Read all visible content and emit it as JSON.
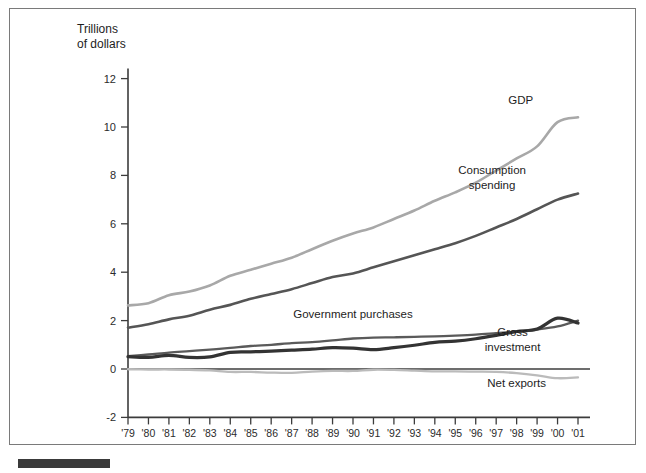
{
  "figure": {
    "y_axis_title_line1": "Trillions",
    "y_axis_title_line2": "of dollars",
    "x_axis_title": "Year"
  },
  "labels": {
    "gdp": "GDP",
    "consumption_line1": "Consumption",
    "consumption_line2": "spending",
    "government": "Government purchases",
    "gross_line1": "Gross",
    "gross_line2": "investment",
    "net_exports": "Net exports"
  },
  "colors": {
    "gdp": "#a8a8a8",
    "consumption": "#555555",
    "government": "#5a5a5a",
    "gross_investment": "#333333",
    "net_exports": "#bbbbbb",
    "axis": "#3c3c3c",
    "frame": "#7a7a7a"
  },
  "chart_data": {
    "type": "line",
    "title": "",
    "xlabel": "Year",
    "ylabel": "Trillions of dollars",
    "grid": false,
    "legend_position": "inline-annotations",
    "xlim": [
      1979,
      2001
    ],
    "ylim": [
      -2,
      12
    ],
    "yticks": [
      -2,
      0,
      2,
      4,
      6,
      8,
      10,
      12
    ],
    "ytick_labels": [
      "-2",
      "0",
      "2",
      "4",
      "6",
      "8",
      "10",
      "12"
    ],
    "x": [
      1979,
      1980,
      1981,
      1982,
      1983,
      1984,
      1985,
      1986,
      1987,
      1988,
      1989,
      1990,
      1991,
      1992,
      1993,
      1994,
      1995,
      1996,
      1997,
      1998,
      1999,
      2000,
      2001
    ],
    "xtick_labels": [
      "'79",
      "'80",
      "'81",
      "'82",
      "'83",
      "'84",
      "'85",
      "'86",
      "'87",
      "'88",
      "'89",
      "'90",
      "'91",
      "'92",
      "'93",
      "'94",
      "'95",
      "'96",
      "'97",
      "'98",
      "'99",
      "'00",
      "'01"
    ],
    "series": [
      {
        "name": "GDP",
        "color": "#a8a8a8",
        "width": 2.6,
        "values": [
          2.63,
          2.72,
          3.05,
          3.2,
          3.45,
          3.85,
          4.1,
          4.35,
          4.6,
          4.95,
          5.3,
          5.6,
          5.85,
          6.2,
          6.55,
          6.95,
          7.3,
          7.7,
          8.2,
          8.7,
          9.2,
          10.2,
          10.4
        ]
      },
      {
        "name": "Consumption spending",
        "color": "#555555",
        "width": 2.6,
        "values": [
          1.71,
          1.85,
          2.05,
          2.2,
          2.45,
          2.65,
          2.9,
          3.1,
          3.3,
          3.55,
          3.8,
          3.95,
          4.2,
          4.45,
          4.7,
          4.95,
          5.2,
          5.5,
          5.85,
          6.2,
          6.6,
          7.0,
          7.25
        ]
      },
      {
        "name": "Government purchases",
        "color": "#5a5a5a",
        "width": 2.3,
        "values": [
          0.53,
          0.6,
          0.68,
          0.74,
          0.8,
          0.87,
          0.95,
          1.0,
          1.07,
          1.11,
          1.18,
          1.26,
          1.3,
          1.31,
          1.33,
          1.35,
          1.38,
          1.42,
          1.48,
          1.54,
          1.63,
          1.76,
          2.0
        ]
      },
      {
        "name": "Gross investment",
        "color": "#333333",
        "width": 3.2,
        "values": [
          0.51,
          0.48,
          0.56,
          0.48,
          0.5,
          0.69,
          0.71,
          0.74,
          0.78,
          0.82,
          0.88,
          0.86,
          0.8,
          0.88,
          0.98,
          1.1,
          1.15,
          1.25,
          1.39,
          1.55,
          1.65,
          2.1,
          1.9
        ]
      },
      {
        "name": "Net exports",
        "color": "#bbbbbb",
        "width": 2.3,
        "values": [
          -0.01,
          -0.02,
          -0.02,
          -0.03,
          -0.06,
          -0.12,
          -0.12,
          -0.15,
          -0.16,
          -0.11,
          -0.08,
          -0.08,
          -0.03,
          -0.04,
          -0.07,
          -0.1,
          -0.1,
          -0.11,
          -0.12,
          -0.17,
          -0.26,
          -0.38,
          -0.35
        ]
      }
    ],
    "annotations": [
      {
        "text": "GDP",
        "x": 1998.2,
        "y": 10.95
      },
      {
        "text": "Consumption spending",
        "x": 1996.8,
        "y": 8.05
      },
      {
        "text": "Government purchases",
        "x": 1990.0,
        "y": 2.1
      },
      {
        "text": "Gross investment",
        "x": 1997.8,
        "y": 1.35
      },
      {
        "text": "Net exports",
        "x": 1998.0,
        "y": -0.75
      }
    ]
  }
}
